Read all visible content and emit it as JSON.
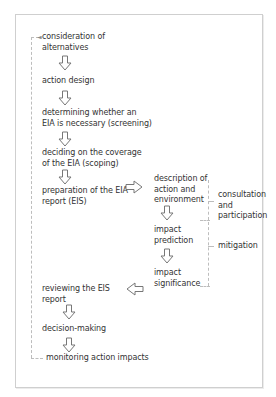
{
  "diagram": {
    "main_steps": [
      {
        "label": "consideration of\nalternatives",
        "line1": "consideration of",
        "line2": "alternatives"
      },
      {
        "label": "action design",
        "line1": "action design"
      },
      {
        "label": "determining whether an EIA is necessary (screening)",
        "line1": "determining whether an",
        "line2": "EIA is necessary (screening)"
      },
      {
        "label": "deciding on the coverage of the EIA (scoping)",
        "line1": "deciding on the coverage",
        "line2": "of the EIA (scoping)"
      },
      {
        "label": "preparation of the EIA report (EIS)",
        "line1": "preparation of the EIA",
        "line2": "report (EIS)"
      },
      {
        "label": "reviewing the EIS report",
        "line1": "reviewing the EIS",
        "line2": "report"
      },
      {
        "label": "decision-making",
        "line1": "decision-making"
      },
      {
        "label": "monitoring action impacts",
        "line1": "monitoring action impacts"
      }
    ],
    "sub_steps": [
      {
        "line1": "description of",
        "line2": "action and",
        "line3": "environment"
      },
      {
        "line1": "impact",
        "line2": "prediction"
      },
      {
        "line1": "impact",
        "line2": "significance"
      }
    ],
    "side_notes": {
      "consultation": {
        "line1": "consultation",
        "line2": "and",
        "line3": "participation"
      },
      "mitigation": {
        "line1": "mitigation"
      }
    },
    "colors": {
      "text": "#333333",
      "arrow": "#777777",
      "border": "#cfcfcf",
      "dash": "#bdbdbd"
    }
  }
}
